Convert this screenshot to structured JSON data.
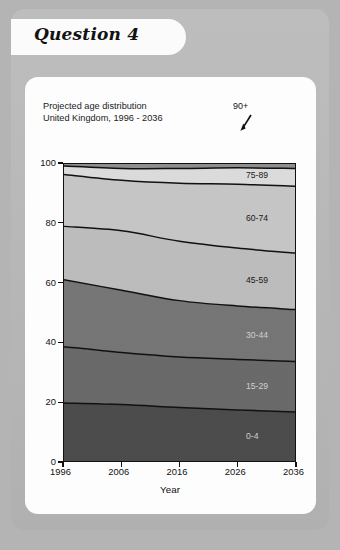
{
  "header": {
    "question_label": "Question 4"
  },
  "figure": {
    "title_line1": "Projected age distribution",
    "title_line2": "United Kingdom, 1996 - 2036",
    "annotation": "90+",
    "annotation_icon": "arrow-down-left-icon"
  },
  "chart_data": {
    "type": "area",
    "title": "Projected age distribution United Kingdom, 1996 - 2036",
    "xlabel": "Year",
    "ylabel": "% of total population",
    "xlim": [
      1996,
      2036
    ],
    "ylim": [
      0,
      100
    ],
    "xticks": [
      "1996",
      "2006",
      "2016",
      "2026",
      "2036"
    ],
    "yticks": [
      "0",
      "20",
      "40",
      "60",
      "80",
      "100"
    ],
    "grid": false,
    "stacked": true,
    "legend": "inline-band-labels",
    "x": [
      1996,
      2006,
      2016,
      2026,
      2036
    ],
    "series": [
      {
        "name": "0-14",
        "color": "#4c4c4c",
        "values": [
          19.5,
          19.0,
          18.0,
          17.2,
          16.5
        ]
      },
      {
        "name": "15-29",
        "color": "#6a6a6a",
        "values": [
          19.0,
          17.5,
          17.0,
          17.0,
          17.0
        ]
      },
      {
        "name": "30-44",
        "color": "#767676",
        "values": [
          22.5,
          21.0,
          19.0,
          18.0,
          17.5
        ]
      },
      {
        "name": "45-59",
        "color": "#bdbdbd",
        "values": [
          18.0,
          20.0,
          20.0,
          19.5,
          19.0
        ]
      },
      {
        "name": "60-74",
        "color": "#c6c6c6",
        "values": [
          17.5,
          17.0,
          19.5,
          21.5,
          22.5
        ]
      },
      {
        "name": "75-89",
        "color": "#dcdcdc",
        "values": [
          2.8,
          4.0,
          5.0,
          5.5,
          6.0
        ]
      },
      {
        "name": "90+",
        "color": "#8f8f8f",
        "values": [
          0.7,
          1.0,
          1.3,
          1.5,
          1.5
        ]
      }
    ],
    "cumulative_boundaries": {
      "0-14": [
        19.5,
        19.0,
        18.0,
        17.2,
        16.5
      ],
      "15-29": [
        38.5,
        36.5,
        35.0,
        34.2,
        33.5
      ],
      "30-44": [
        61.0,
        57.5,
        54.0,
        52.2,
        51.0
      ],
      "45-59": [
        79.0,
        77.5,
        74.0,
        71.7,
        70.0
      ],
      "60-74": [
        96.5,
        94.5,
        93.5,
        93.2,
        92.5
      ],
      "75-89": [
        99.3,
        98.5,
        98.5,
        98.7,
        98.5
      ],
      "90+": [
        100,
        100,
        100,
        100,
        100
      ]
    },
    "band_labels": [
      {
        "name": "75-89",
        "tone": "dark"
      },
      {
        "name": "60-74",
        "tone": "dark"
      },
      {
        "name": "45-59",
        "tone": "dark"
      },
      {
        "name": "30-44",
        "tone": "light"
      },
      {
        "name": "15-29",
        "tone": "light"
      },
      {
        "name": "0-4",
        "tone": "light"
      }
    ]
  }
}
